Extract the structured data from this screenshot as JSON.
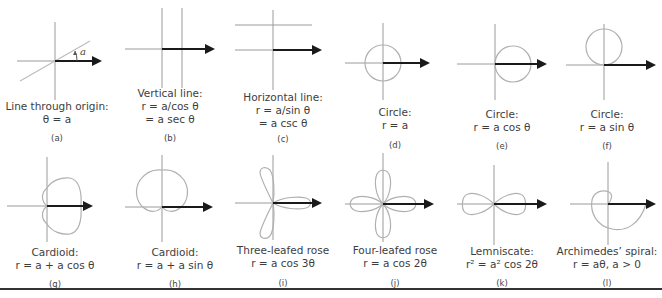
{
  "figure": {
    "colors": {
      "curve": "#b5b5b5",
      "axis": "#9a9a9a",
      "arrow": "#1a1a1a",
      "text": "#3d3d3d"
    },
    "panels": [
      {
        "id": "a",
        "label": "(a)",
        "title": "Line through origin:",
        "eq1": "θ = a",
        "eq2": "",
        "angle_label": "a"
      },
      {
        "id": "b",
        "label": "(b)",
        "title": "Vertical line:",
        "eq1": "r = a/cos θ",
        "eq2": "= a sec θ"
      },
      {
        "id": "c",
        "label": "(c)",
        "title": "Horizontal line:",
        "eq1": "r = a/sin θ",
        "eq2": "= a csc θ"
      },
      {
        "id": "d",
        "label": "(d)",
        "title": "Circle:",
        "eq1": "r = a",
        "eq2": ""
      },
      {
        "id": "e",
        "label": "(e)",
        "title": "Circle:",
        "eq1": "r = a cos θ",
        "eq2": ""
      },
      {
        "id": "f",
        "label": "(f)",
        "title": "Circle:",
        "eq1": "r = a sin θ",
        "eq2": ""
      },
      {
        "id": "g",
        "label": "(g)",
        "title": "Cardioid:",
        "eq1": "r = a + a cos θ",
        "eq2": ""
      },
      {
        "id": "h",
        "label": "(h)",
        "title": "Cardioid:",
        "eq1": "r = a + a sin θ",
        "eq2": ""
      },
      {
        "id": "i",
        "label": "(i)",
        "title": "Three-leafed rose",
        "eq1": "r = a cos 3θ",
        "eq2": ""
      },
      {
        "id": "j",
        "label": "(j)",
        "title": "Four-leafed rose",
        "eq1": "r = a cos 2θ",
        "eq2": ""
      },
      {
        "id": "k",
        "label": "(k)",
        "title": "Lemniscate:",
        "eq1": "r² = a² cos 2θ",
        "eq2": ""
      },
      {
        "id": "l",
        "label": "(l)",
        "title": "Archimedes’ spiral:",
        "eq1": "r = aθ, a > 0",
        "eq2": ""
      }
    ]
  }
}
